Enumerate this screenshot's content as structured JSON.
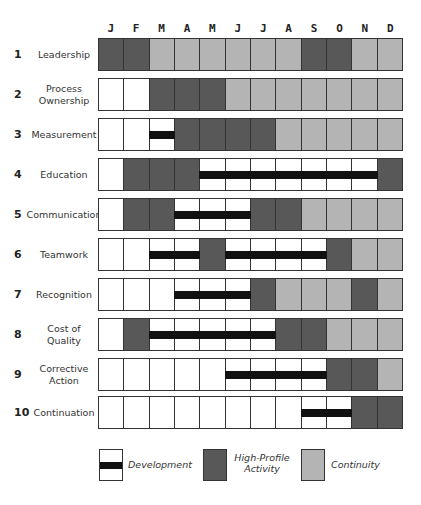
{
  "chart_data": {
    "type": "table",
    "title": "",
    "months": [
      "J",
      "F",
      "M",
      "A",
      "M",
      "J",
      "J",
      "A",
      "S",
      "O",
      "N",
      "D"
    ],
    "legend_codes": {
      "w": "Empty",
      "d": "Development",
      "h": "High-Profile Activity",
      "c": "Continuity"
    },
    "rows": [
      {
        "num": "1",
        "label": "Leadership",
        "cells": [
          "h",
          "h",
          "c",
          "c",
          "c",
          "c",
          "c",
          "c",
          "h",
          "h",
          "c",
          "c"
        ]
      },
      {
        "num": "2",
        "label": "Process Ownership",
        "cells": [
          "w",
          "w",
          "h",
          "h",
          "h",
          "c",
          "c",
          "c",
          "c",
          "c",
          "c",
          "c"
        ]
      },
      {
        "num": "3",
        "label": "Measurement",
        "cells": [
          "w",
          "w",
          "d",
          "h",
          "h",
          "h",
          "h",
          "c",
          "c",
          "c",
          "c",
          "c"
        ]
      },
      {
        "num": "4",
        "label": "Education",
        "cells": [
          "w",
          "h",
          "h",
          "h",
          "d",
          "d",
          "d",
          "d",
          "d",
          "d",
          "d",
          "h"
        ]
      },
      {
        "num": "5",
        "label": "Communication",
        "cells": [
          "w",
          "h",
          "h",
          "d",
          "d",
          "d",
          "h",
          "h",
          "c",
          "c",
          "c",
          "c"
        ]
      },
      {
        "num": "6",
        "label": "Teamwork",
        "cells": [
          "w",
          "w",
          "d",
          "d",
          "h",
          "d",
          "d",
          "d",
          "d",
          "h",
          "c",
          "c"
        ]
      },
      {
        "num": "7",
        "label": "Recognition",
        "cells": [
          "w",
          "w",
          "w",
          "d",
          "d",
          "d",
          "h",
          "c",
          "c",
          "c",
          "h",
          "c"
        ]
      },
      {
        "num": "8",
        "label": "Cost of Quality",
        "cells": [
          "w",
          "h",
          "d",
          "d",
          "d",
          "d",
          "d",
          "h",
          "h",
          "c",
          "c",
          "c"
        ]
      },
      {
        "num": "9",
        "label": "Corrective Action",
        "cells": [
          "w",
          "w",
          "w",
          "w",
          "w",
          "d",
          "d",
          "d",
          "d",
          "h",
          "h",
          "c"
        ]
      },
      {
        "num": "10",
        "label": "Continuation",
        "cells": [
          "w",
          "w",
          "w",
          "w",
          "w",
          "w",
          "w",
          "w",
          "d",
          "d",
          "h",
          "h"
        ]
      }
    ]
  },
  "months": [
    "J",
    "F",
    "M",
    "A",
    "M",
    "J",
    "J",
    "A",
    "S",
    "O",
    "N",
    "D"
  ],
  "rows": [
    {
      "num": "1",
      "label": "Leadership"
    },
    {
      "num": "2",
      "label": "Process Ownership"
    },
    {
      "num": "3",
      "label": "Measurement"
    },
    {
      "num": "4",
      "label": "Education"
    },
    {
      "num": "5",
      "label": "Communication"
    },
    {
      "num": "6",
      "label": "Teamwork"
    },
    {
      "num": "7",
      "label": "Recognition"
    },
    {
      "num": "8",
      "label": "Cost of Quality"
    },
    {
      "num": "9",
      "label": "Corrective Action"
    },
    {
      "num": "10",
      "label": "Continuation"
    }
  ],
  "legend": {
    "development": "Development",
    "high_profile": "High-Profile Activity",
    "continuity": "Continuity"
  },
  "colors": {
    "high_profile": "#585858",
    "continuity": "#b4b4b4",
    "development_bar": "#111111",
    "empty": "#ffffff"
  }
}
